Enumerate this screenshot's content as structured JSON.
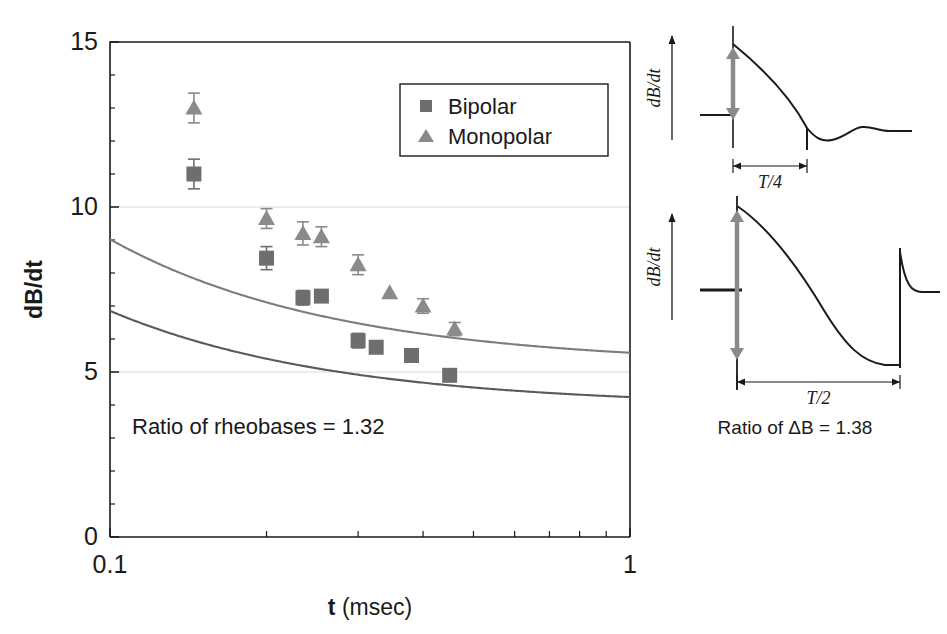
{
  "figure": {
    "background": "#ffffff",
    "ink": "#1a1a1a"
  },
  "chart_data": {
    "type": "scatter",
    "title": "",
    "xlabel_bold": "t",
    "xlabel_unit": " (msec)",
    "ylabel": "dB/dt",
    "xscale": "log",
    "xlim": [
      0.1,
      1.0
    ],
    "ylim": [
      0,
      15
    ],
    "xticks": [
      0.1,
      1
    ],
    "xticklabels": [
      "0.1",
      "1"
    ],
    "xminorticks": [
      0.2,
      0.3,
      0.4,
      0.5,
      0.6,
      0.7,
      0.8,
      0.9
    ],
    "yticks": [
      0,
      5,
      10,
      15
    ],
    "yticklabels": [
      "0",
      "5",
      "10",
      "15"
    ],
    "yminorticks": [
      1,
      2,
      3,
      4,
      6,
      7,
      8,
      9,
      11,
      12,
      13,
      14
    ],
    "gridlines_y": [
      5,
      10
    ],
    "grid": "horizontal-faint",
    "legend_position": "top-right-inside",
    "annotation": "Ratio of rheobases = 1.32",
    "series": [
      {
        "name": "Bipolar",
        "marker": "square",
        "color": "#6e6e6e",
        "curve_color": "#5a5a5a",
        "points": [
          {
            "x": 0.145,
            "y": 11.0,
            "err": 0.45
          },
          {
            "x": 0.2,
            "y": 8.45,
            "err": 0.35
          },
          {
            "x": 0.235,
            "y": 7.25,
            "err": 0.22
          },
          {
            "x": 0.255,
            "y": 7.3,
            "err": 0.0
          },
          {
            "x": 0.3,
            "y": 5.95,
            "err": 0.22
          },
          {
            "x": 0.325,
            "y": 5.75,
            "err": 0.0
          },
          {
            "x": 0.38,
            "y": 5.5,
            "err": 0.2
          },
          {
            "x": 0.45,
            "y": 4.9,
            "err": 0.0
          }
        ],
        "fit": {
          "rheobase": 3.95,
          "chronaxie": 0.0735
        }
      },
      {
        "name": "Monopolar",
        "marker": "triangle",
        "color": "#8a8a8a",
        "curve_color": "#7d7d7d",
        "points": [
          {
            "x": 0.145,
            "y": 13.0,
            "err": 0.45
          },
          {
            "x": 0.2,
            "y": 9.65,
            "err": 0.3
          },
          {
            "x": 0.235,
            "y": 9.2,
            "err": 0.35
          },
          {
            "x": 0.255,
            "y": 9.1,
            "err": 0.3
          },
          {
            "x": 0.3,
            "y": 8.25,
            "err": 0.3
          },
          {
            "x": 0.345,
            "y": 7.4,
            "err": 0.0
          },
          {
            "x": 0.4,
            "y": 7.0,
            "err": 0.22
          },
          {
            "x": 0.46,
            "y": 6.3,
            "err": 0.2
          }
        ],
        "fit": {
          "rheobase": 5.2,
          "chronaxie": 0.0735
        }
      }
    ]
  },
  "waveform_panels": [
    {
      "id": "upper",
      "ylabel": "dB/dt",
      "duration_label": "T/4",
      "arrow_color": "#8a8a8a",
      "trace_color": "#1a1a1a"
    },
    {
      "id": "lower",
      "ylabel": "dB/dt",
      "duration_label": "T/2",
      "arrow_color": "#8a8a8a",
      "trace_color": "#1a1a1a"
    }
  ],
  "waveform_caption": "Ratio of ΔB = 1.38"
}
